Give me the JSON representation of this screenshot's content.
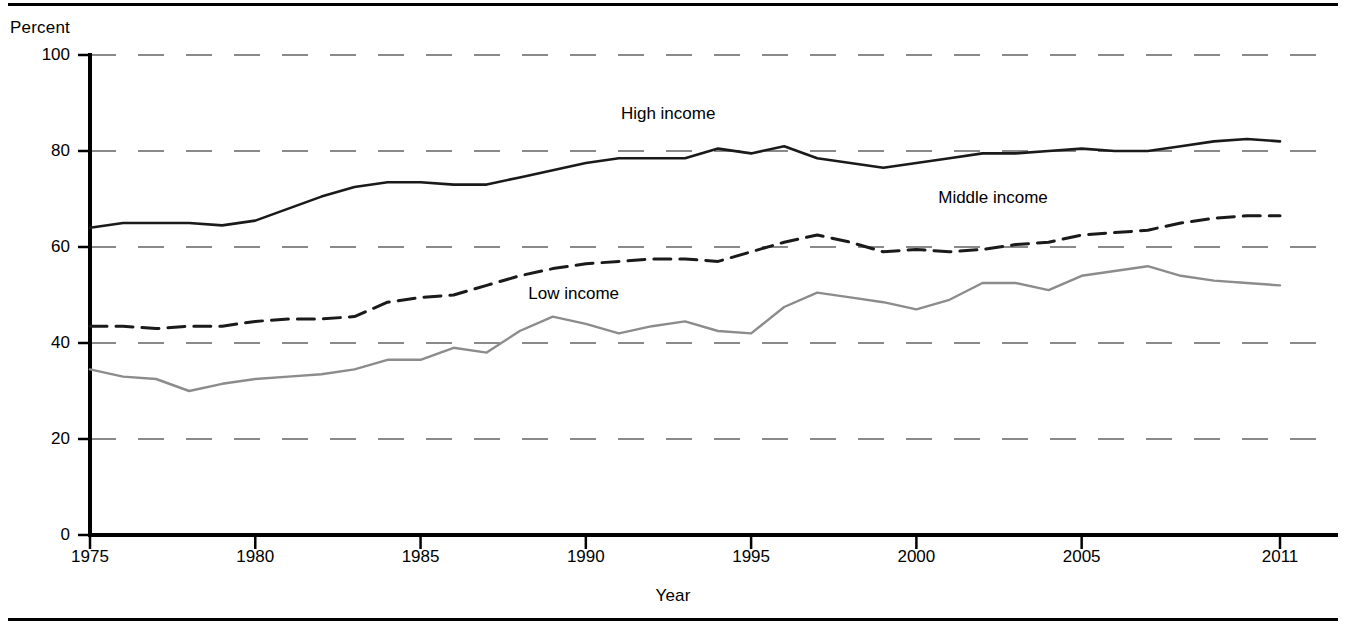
{
  "figure": {
    "y_axis_title": "Percent",
    "x_axis_title": "Year"
  },
  "chart_data": {
    "type": "line",
    "title": "",
    "xlabel": "Year",
    "ylabel": "Percent",
    "xlim": [
      1975,
      2011
    ],
    "ylim": [
      0,
      100
    ],
    "grid": true,
    "grid_style": "dashed-horizontal",
    "legend": "inline-labels",
    "yticks": [
      0,
      20,
      40,
      60,
      80,
      100
    ],
    "xticks": [
      1975,
      1980,
      1985,
      1990,
      1995,
      2000,
      2005,
      2011
    ],
    "x": [
      1975,
      1976,
      1977,
      1978,
      1979,
      1980,
      1981,
      1982,
      1983,
      1984,
      1985,
      1986,
      1987,
      1988,
      1989,
      1990,
      1991,
      1992,
      1993,
      1994,
      1995,
      1996,
      1997,
      1998,
      1999,
      2000,
      2001,
      2002,
      2003,
      2004,
      2005,
      2006,
      2007,
      2008,
      2009,
      2010,
      2011
    ],
    "series": [
      {
        "name": "High income",
        "style": "solid",
        "color": "#1a1a1a",
        "width": 2.6,
        "label_x": 1991.0,
        "label_y": 87.5,
        "values": [
          64.0,
          65.0,
          65.0,
          65.0,
          64.5,
          65.5,
          68.0,
          70.5,
          72.5,
          73.5,
          73.5,
          73.0,
          73.0,
          74.5,
          76.0,
          77.5,
          78.5,
          78.5,
          78.5,
          80.5,
          79.5,
          81.0,
          78.5,
          77.5,
          76.5,
          77.5,
          78.5,
          79.5,
          79.5,
          80.0,
          80.5,
          80.0,
          80.0,
          81.0,
          82.0,
          82.5,
          82.0
        ]
      },
      {
        "name": "Middle income",
        "style": "dashed",
        "color": "#1a1a1a",
        "width": 3.0,
        "label_x": 2000.6,
        "label_y": 70.0,
        "values": [
          43.5,
          43.5,
          43.0,
          43.5,
          43.5,
          44.5,
          45.0,
          45.0,
          45.5,
          48.5,
          49.5,
          50.0,
          52.0,
          54.0,
          55.5,
          56.5,
          57.0,
          57.5,
          57.5,
          57.0,
          59.0,
          61.0,
          62.5,
          61.0,
          59.0,
          59.5,
          59.0,
          59.5,
          60.5,
          61.0,
          62.5,
          63.0,
          63.5,
          65.0,
          66.0,
          66.5,
          66.5
        ]
      },
      {
        "name": "Low income",
        "style": "solid",
        "color": "#8c8c8c",
        "width": 2.4,
        "label_x": 1988.2,
        "label_y": 50.0,
        "values": [
          34.5,
          33.0,
          32.5,
          30.0,
          31.5,
          32.5,
          33.0,
          33.5,
          34.5,
          36.5,
          36.5,
          39.0,
          38.0,
          42.5,
          45.5,
          44.0,
          42.0,
          43.5,
          44.5,
          42.5,
          42.0,
          47.5,
          50.5,
          49.5,
          48.5,
          47.0,
          49.0,
          52.5,
          52.5,
          51.0,
          54.0,
          55.0,
          56.0,
          54.0,
          53.0,
          52.5,
          52.0
        ]
      }
    ]
  }
}
